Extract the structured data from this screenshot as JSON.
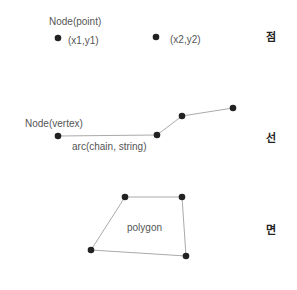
{
  "point_section": {
    "title": "Node(point)",
    "p1_label": "(x1,y1)",
    "p2_label": "(x2,y2)",
    "korean": "점"
  },
  "line_section": {
    "title": "Node(vertex)",
    "arc_label": "arc(chain, string)",
    "korean": "선"
  },
  "polygon_section": {
    "label": "polygon",
    "korean": "면"
  },
  "colors": {
    "node": "#222222",
    "edge": "#aaaaaa",
    "text": "#555555"
  }
}
